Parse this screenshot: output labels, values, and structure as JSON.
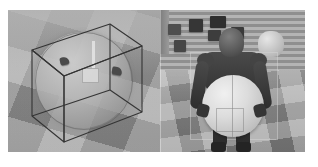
{
  "figure": {
    "caption": "",
    "panel_count": 2,
    "background_color": "#ffffff"
  },
  "panels": [
    {
      "id": "left",
      "name": "wireframe-bounding-box-view",
      "description": "Transparent wireframe bounding cube enclosing a large sphere on a checkered floor",
      "scene_color": "#9c9c9c",
      "objects": [
        {
          "name": "wireframe-cube",
          "type": "bounding-box",
          "color": "#3a3a3a"
        },
        {
          "name": "sphere",
          "type": "ball",
          "color": "#c8c8c8"
        },
        {
          "name": "gripper-marker-left",
          "type": "marker",
          "color": "#4a4a4a"
        },
        {
          "name": "gripper-marker-right",
          "type": "marker",
          "color": "#4a4a4a"
        },
        {
          "name": "probe-stem",
          "type": "probe",
          "color": "#e2e2e2"
        },
        {
          "name": "probe-head",
          "type": "probe",
          "color": "#dadada"
        },
        {
          "name": "checkered-floor",
          "type": "ground-plane",
          "color": "#a2a2a2"
        }
      ]
    },
    {
      "id": "right",
      "name": "humanoid-carrying-ball-view",
      "description": "Humanoid robot seen from behind carrying a large ball across a checkered floor",
      "scene_color": "#8e8e8e",
      "objects": [
        {
          "name": "humanoid-robot",
          "type": "agent",
          "color": "#3d3d3d"
        },
        {
          "name": "carried-ball",
          "type": "ball",
          "color": "#dcdcdc"
        },
        {
          "name": "background-box-a",
          "type": "obstacle",
          "color": "#4f4f4f"
        },
        {
          "name": "background-box-b",
          "type": "obstacle",
          "color": "#363636"
        },
        {
          "name": "background-box-c",
          "type": "obstacle",
          "color": "#2f2f2f"
        },
        {
          "name": "background-box-d",
          "type": "obstacle",
          "color": "#3d3d3d"
        },
        {
          "name": "background-box-e",
          "type": "obstacle",
          "color": "#3a3a3a"
        },
        {
          "name": "background-box-f",
          "type": "obstacle",
          "color": "#474747"
        },
        {
          "name": "background-cylinder",
          "type": "obstacle",
          "color": "#c8c8c8"
        },
        {
          "name": "striped-wall",
          "type": "backdrop",
          "color": "#b4b4b4"
        },
        {
          "name": "checkered-floor",
          "type": "ground-plane",
          "color": "#9d9d9d"
        }
      ]
    }
  ]
}
